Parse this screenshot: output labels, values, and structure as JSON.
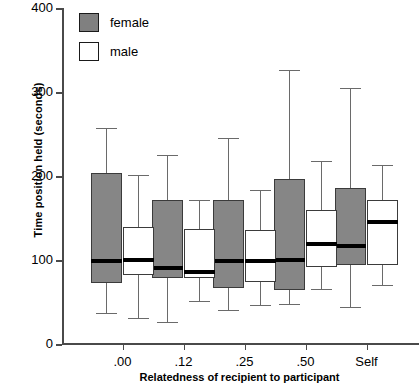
{
  "chart_data": {
    "type": "boxplot",
    "title": "",
    "xlabel": "Relatedness of recipient to participant",
    "ylabel": "Time position held (seconds)",
    "categories": [
      ".00",
      ".12",
      ".25",
      ".50",
      "Self"
    ],
    "ylim": [
      0,
      400
    ],
    "yticks": [
      0,
      100,
      200,
      300,
      400
    ],
    "grid": false,
    "legend": {
      "position": "top-left",
      "entries": [
        {
          "label": "female",
          "color": "#808080"
        },
        {
          "label": "male",
          "color": "#ffffff"
        }
      ]
    },
    "series": [
      {
        "name": "female",
        "color": "#868686",
        "boxes": [
          {
            "category": ".00",
            "whisker_low": 37,
            "q1": 73,
            "median": 99,
            "q3": 204,
            "whisker_high": 257
          },
          {
            "category": ".12",
            "whisker_low": 26,
            "q1": 79,
            "median": 90,
            "q3": 172,
            "whisker_high": 225
          },
          {
            "category": ".25",
            "whisker_low": 41,
            "q1": 67,
            "median": 99,
            "q3": 172,
            "whisker_high": 245
          },
          {
            "category": ".50",
            "whisker_low": 48,
            "q1": 64,
            "median": 100,
            "q3": 196,
            "whisker_high": 326
          },
          {
            "category": "Self",
            "whisker_low": 44,
            "q1": 94,
            "median": 117,
            "q3": 186,
            "whisker_high": 305
          }
        ]
      },
      {
        "name": "male",
        "color": "#ffffff",
        "boxes": [
          {
            "category": ".00",
            "whisker_low": 31,
            "q1": 82,
            "median": 100,
            "q3": 139,
            "whisker_high": 201
          },
          {
            "category": ".12",
            "whisker_low": 51,
            "q1": 79,
            "median": 86,
            "q3": 137,
            "whisker_high": 172
          },
          {
            "category": ".25",
            "whisker_low": 47,
            "q1": 74,
            "median": 99,
            "q3": 136,
            "whisker_high": 183
          },
          {
            "category": ".50",
            "whisker_low": 66,
            "q1": 92,
            "median": 119,
            "q3": 160,
            "whisker_high": 218
          },
          {
            "category": "Self",
            "whisker_low": 70,
            "q1": 94,
            "median": 145,
            "q3": 172,
            "whisker_high": 213
          }
        ]
      }
    ]
  },
  "axis": {
    "y_tick_labels": [
      "400",
      "300",
      "200",
      "100",
      "0"
    ],
    "x_tick_labels": [
      ".00",
      ".12",
      ".25",
      ".50",
      "Self"
    ]
  }
}
